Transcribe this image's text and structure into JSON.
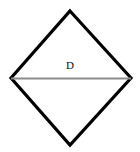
{
  "placard": {
    "shape": "diamond",
    "label": "D",
    "background_color": "#ffffff",
    "border_color": "#000000",
    "border_width_px": 3,
    "divider_line": {
      "name": "horizontal-divider-line",
      "color": "#8c8c8c",
      "width_px": 2,
      "y_px": 78
    },
    "geometry": {
      "top_vertex": [
        70,
        11
      ],
      "right_vertex": [
        131,
        78
      ],
      "bottom_vertex": [
        70,
        145
      ],
      "left_vertex": [
        11,
        78
      ]
    },
    "label_position": [
      70,
      68
    ]
  }
}
